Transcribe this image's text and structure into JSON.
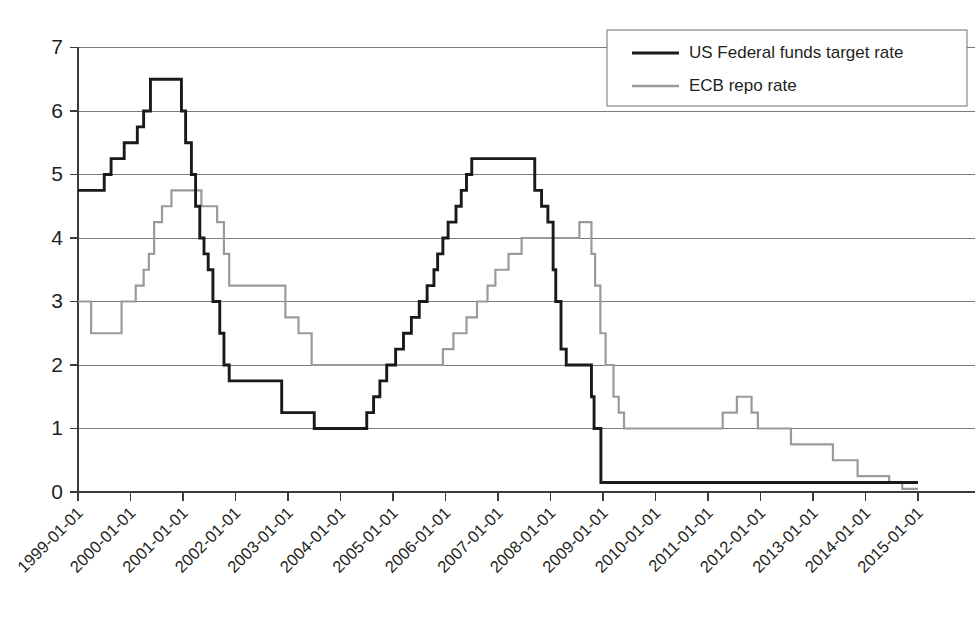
{
  "chart_data": {
    "type": "line",
    "title": "",
    "subtitle": "",
    "xlabel": "",
    "ylabel": "",
    "xlim": [
      "1999-01-01",
      "2015-01-01"
    ],
    "ylim": [
      0,
      7
    ],
    "grid": true,
    "step_style": "post",
    "legend_position": "top-right",
    "y_ticks": [
      "0",
      "1",
      "2",
      "3",
      "4",
      "5",
      "6",
      "7"
    ],
    "x_ticks": [
      "1999-01-01",
      "2000-01-01",
      "2001-01-01",
      "2002-01-01",
      "2003-01-01",
      "2004-01-01",
      "2005-01-01",
      "2006-01-01",
      "2007-01-01",
      "2008-01-01",
      "2009-01-01",
      "2010-01-01",
      "2011-01-01",
      "2012-01-01",
      "2013-01-01",
      "2014-01-01",
      "2015-01-01"
    ],
    "series": [
      {
        "name": "US Federal funds target rate",
        "color": "#1a1a1a",
        "points": [
          {
            "x": 1999.0,
            "y": 4.75
          },
          {
            "x": 1999.5,
            "y": 5.0
          },
          {
            "x": 1999.63,
            "y": 5.25
          },
          {
            "x": 1999.88,
            "y": 5.5
          },
          {
            "x": 2000.13,
            "y": 5.75
          },
          {
            "x": 2000.25,
            "y": 6.0
          },
          {
            "x": 2000.38,
            "y": 6.5
          },
          {
            "x": 2000.97,
            "y": 6.0
          },
          {
            "x": 2001.05,
            "y": 5.5
          },
          {
            "x": 2001.16,
            "y": 5.0
          },
          {
            "x": 2001.24,
            "y": 4.5
          },
          {
            "x": 2001.32,
            "y": 4.0
          },
          {
            "x": 2001.4,
            "y": 3.75
          },
          {
            "x": 2001.48,
            "y": 3.5
          },
          {
            "x": 2001.57,
            "y": 3.0
          },
          {
            "x": 2001.7,
            "y": 2.5
          },
          {
            "x": 2001.78,
            "y": 2.0
          },
          {
            "x": 2001.88,
            "y": 1.75
          },
          {
            "x": 2002.88,
            "y": 1.25
          },
          {
            "x": 2003.5,
            "y": 1.0
          },
          {
            "x": 2004.5,
            "y": 1.25
          },
          {
            "x": 2004.63,
            "y": 1.5
          },
          {
            "x": 2004.75,
            "y": 1.75
          },
          {
            "x": 2004.88,
            "y": 2.0
          },
          {
            "x": 2005.05,
            "y": 2.25
          },
          {
            "x": 2005.2,
            "y": 2.5
          },
          {
            "x": 2005.35,
            "y": 2.75
          },
          {
            "x": 2005.5,
            "y": 3.0
          },
          {
            "x": 2005.65,
            "y": 3.25
          },
          {
            "x": 2005.78,
            "y": 3.5
          },
          {
            "x": 2005.85,
            "y": 3.75
          },
          {
            "x": 2005.95,
            "y": 4.0
          },
          {
            "x": 2006.05,
            "y": 4.25
          },
          {
            "x": 2006.2,
            "y": 4.5
          },
          {
            "x": 2006.3,
            "y": 4.75
          },
          {
            "x": 2006.4,
            "y": 5.0
          },
          {
            "x": 2006.5,
            "y": 5.25
          },
          {
            "x": 2007.7,
            "y": 4.75
          },
          {
            "x": 2007.83,
            "y": 4.5
          },
          {
            "x": 2007.95,
            "y": 4.25
          },
          {
            "x": 2008.05,
            "y": 3.5
          },
          {
            "x": 2008.1,
            "y": 3.0
          },
          {
            "x": 2008.2,
            "y": 2.25
          },
          {
            "x": 2008.3,
            "y": 2.0
          },
          {
            "x": 2008.78,
            "y": 1.5
          },
          {
            "x": 2008.83,
            "y": 1.0
          },
          {
            "x": 2008.96,
            "y": 0.15
          },
          {
            "x": 2015.0,
            "y": 0.15
          }
        ]
      },
      {
        "name": "ECB repo rate",
        "color": "#9a9a9a",
        "points": [
          {
            "x": 1999.0,
            "y": 3.0
          },
          {
            "x": 1999.25,
            "y": 2.5
          },
          {
            "x": 1999.83,
            "y": 3.0
          },
          {
            "x": 2000.1,
            "y": 3.25
          },
          {
            "x": 2000.25,
            "y": 3.5
          },
          {
            "x": 2000.35,
            "y": 3.75
          },
          {
            "x": 2000.45,
            "y": 4.25
          },
          {
            "x": 2000.6,
            "y": 4.5
          },
          {
            "x": 2000.78,
            "y": 4.75
          },
          {
            "x": 2001.35,
            "y": 4.5
          },
          {
            "x": 2001.65,
            "y": 4.25
          },
          {
            "x": 2001.78,
            "y": 3.75
          },
          {
            "x": 2001.88,
            "y": 3.25
          },
          {
            "x": 2002.95,
            "y": 2.75
          },
          {
            "x": 2003.2,
            "y": 2.5
          },
          {
            "x": 2003.45,
            "y": 2.0
          },
          {
            "x": 2005.95,
            "y": 2.25
          },
          {
            "x": 2006.15,
            "y": 2.5
          },
          {
            "x": 2006.4,
            "y": 2.75
          },
          {
            "x": 2006.6,
            "y": 3.0
          },
          {
            "x": 2006.8,
            "y": 3.25
          },
          {
            "x": 2006.95,
            "y": 3.5
          },
          {
            "x": 2007.2,
            "y": 3.75
          },
          {
            "x": 2007.45,
            "y": 4.0
          },
          {
            "x": 2008.55,
            "y": 4.25
          },
          {
            "x": 2008.78,
            "y": 3.75
          },
          {
            "x": 2008.85,
            "y": 3.25
          },
          {
            "x": 2008.95,
            "y": 2.5
          },
          {
            "x": 2009.05,
            "y": 2.0
          },
          {
            "x": 2009.2,
            "y": 1.5
          },
          {
            "x": 2009.3,
            "y": 1.25
          },
          {
            "x": 2009.4,
            "y": 1.0
          },
          {
            "x": 2011.28,
            "y": 1.25
          },
          {
            "x": 2011.55,
            "y": 1.5
          },
          {
            "x": 2011.83,
            "y": 1.25
          },
          {
            "x": 2011.95,
            "y": 1.0
          },
          {
            "x": 2012.58,
            "y": 0.75
          },
          {
            "x": 2013.38,
            "y": 0.5
          },
          {
            "x": 2013.85,
            "y": 0.25
          },
          {
            "x": 2014.45,
            "y": 0.15
          },
          {
            "x": 2014.7,
            "y": 0.05
          },
          {
            "x": 2015.0,
            "y": 0.05
          }
        ]
      }
    ],
    "legend": [
      {
        "label": "US Federal funds target rate",
        "style": "solid",
        "color": "#1a1a1a"
      },
      {
        "label": "ECB repo rate",
        "style": "solid",
        "color": "#9a9a9a"
      }
    ]
  }
}
